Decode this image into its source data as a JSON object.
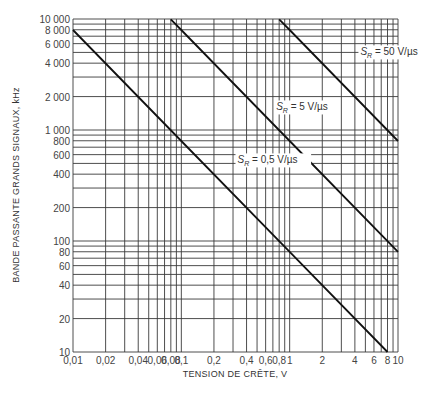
{
  "chart_data": {
    "type": "line",
    "title": "",
    "xlabel": "TENSION DE CRÊTE, V",
    "ylabel": "BANDE PASSANTE GRANDS SIGNAUX, kHz",
    "xscale": "log",
    "yscale": "log",
    "xlim": [
      0.01,
      10
    ],
    "ylim": [
      10,
      10000
    ],
    "grid": true,
    "x_ticks": [
      {
        "v": 0.01,
        "label": "0,01"
      },
      {
        "v": 0.02,
        "label": "0,02"
      },
      {
        "v": 0.04,
        "label": "0,04"
      },
      {
        "v": 0.06,
        "label": "0,06"
      },
      {
        "v": 0.08,
        "label": "0,08"
      },
      {
        "v": 0.1,
        "label": "0,1"
      },
      {
        "v": 0.2,
        "label": "0,2"
      },
      {
        "v": 0.4,
        "label": "0,4"
      },
      {
        "v": 0.6,
        "label": "0,6"
      },
      {
        "v": 0.8,
        "label": "0,8"
      },
      {
        "v": 1,
        "label": "1"
      },
      {
        "v": 2,
        "label": "2"
      },
      {
        "v": 4,
        "label": "4"
      },
      {
        "v": 6,
        "label": "6"
      },
      {
        "v": 8,
        "label": "8"
      },
      {
        "v": 10,
        "label": "10"
      }
    ],
    "y_ticks": [
      {
        "v": 10,
        "label": "10"
      },
      {
        "v": 20,
        "label": "20"
      },
      {
        "v": 40,
        "label": "40"
      },
      {
        "v": 60,
        "label": "60"
      },
      {
        "v": 80,
        "label": "80"
      },
      {
        "v": 100,
        "label": "100"
      },
      {
        "v": 200,
        "label": "200"
      },
      {
        "v": 400,
        "label": "400"
      },
      {
        "v": 600,
        "label": "600"
      },
      {
        "v": 800,
        "label": "800"
      },
      {
        "v": 1000,
        "label": "1 000"
      },
      {
        "v": 2000,
        "label": "2 000"
      },
      {
        "v": 4000,
        "label": "4 000"
      },
      {
        "v": 6000,
        "label": "6 000"
      },
      {
        "v": 8000,
        "label": "8 000"
      },
      {
        "v": 10000,
        "label": "10 000"
      }
    ],
    "series": [
      {
        "name": "S_R = 0,5 V/µs",
        "label_main": "S",
        "label_sub": "R",
        "label_rest": " = 0,5 V/µs",
        "slew_V_per_us": 0.5,
        "x": [
          0.01,
          0.1,
          1,
          8
        ],
        "y": [
          7958,
          796,
          80,
          10
        ],
        "label_pos": [
          0.33,
          500
        ]
      },
      {
        "name": "S_R = 5 V/µs",
        "label_main": "S",
        "label_sub": "R",
        "label_rest": " = 5 V/µs",
        "slew_V_per_us": 5,
        "x": [
          0.08,
          0.1,
          1,
          10
        ],
        "y": [
          9947,
          7958,
          796,
          80
        ],
        "label_pos": [
          0.75,
          1500
        ]
      },
      {
        "name": "S_R = 50 V/µs",
        "label_main": "S",
        "label_sub": "R",
        "label_rest": " = 50 V/µs",
        "slew_V_per_us": 50,
        "x": [
          0.8,
          1,
          10
        ],
        "y": [
          9947,
          7958,
          796
        ],
        "label_pos": [
          4.5,
          4700
        ]
      }
    ]
  }
}
